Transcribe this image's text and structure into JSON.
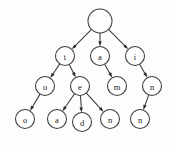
{
  "figure": {
    "background_color": "#fdfdfd",
    "stroke_color": "#3a3a3a",
    "label_color": "#1b1b1b",
    "node_fill": "#ffffff",
    "width": 176,
    "height": 151
  },
  "chart_data": {
    "type": "diagram",
    "diagram_type": "trie",
    "title": "",
    "directed": true,
    "nodes": [
      {
        "id": "root",
        "label": "",
        "cx": 100,
        "cy": 21,
        "r": 12,
        "level": 0
      },
      {
        "id": "t",
        "label": "t",
        "cx": 65,
        "cy": 56,
        "r": 9.5,
        "level": 1
      },
      {
        "id": "a",
        "label": "a",
        "cx": 100,
        "cy": 56,
        "r": 9.5,
        "level": 1
      },
      {
        "id": "i",
        "label": "i",
        "cx": 135,
        "cy": 56,
        "r": 9.5,
        "level": 1
      },
      {
        "id": "t-o",
        "label": "o",
        "cx": 45,
        "cy": 86,
        "r": 9.5,
        "level": 2
      },
      {
        "id": "t-e",
        "label": "e",
        "cx": 80,
        "cy": 86,
        "r": 9.5,
        "level": 2
      },
      {
        "id": "a-m",
        "label": "m",
        "cx": 117,
        "cy": 86,
        "r": 9.5,
        "level": 2
      },
      {
        "id": "i-n",
        "label": "n",
        "cx": 152,
        "cy": 86,
        "r": 9.5,
        "level": 2
      },
      {
        "id": "t-o-o",
        "label": "o",
        "cx": 25,
        "cy": 119,
        "r": 9.5,
        "level": 3
      },
      {
        "id": "t-e-a",
        "label": "a",
        "cx": 57,
        "cy": 119,
        "r": 9.5,
        "level": 3
      },
      {
        "id": "t-e-d",
        "label": "d",
        "cx": 82,
        "cy": 122,
        "r": 9.5,
        "level": 3
      },
      {
        "id": "t-e-n",
        "label": "n",
        "cx": 110,
        "cy": 119,
        "r": 9.5,
        "level": 3
      },
      {
        "id": "i-n-n",
        "label": "n",
        "cx": 140,
        "cy": 119,
        "r": 9.5,
        "level": 3
      }
    ],
    "edges": [
      {
        "from": "root",
        "to": "t"
      },
      {
        "from": "root",
        "to": "a"
      },
      {
        "from": "root",
        "to": "i"
      },
      {
        "from": "t",
        "to": "t-o"
      },
      {
        "from": "t",
        "to": "t-e"
      },
      {
        "from": "a",
        "to": "a-m"
      },
      {
        "from": "i",
        "to": "i-n"
      },
      {
        "from": "t-o",
        "to": "t-o-o"
      },
      {
        "from": "t-e",
        "to": "t-e-a"
      },
      {
        "from": "t-e",
        "to": "t-e-d"
      },
      {
        "from": "t-e",
        "to": "t-e-n"
      },
      {
        "from": "i-n",
        "to": "i-n-n"
      }
    ],
    "words": [
      "too",
      "tea",
      "ted",
      "ten",
      "am",
      "inn"
    ]
  }
}
